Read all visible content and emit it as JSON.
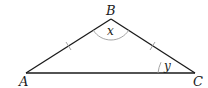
{
  "diagram": {
    "type": "isosceles-triangle",
    "vertices": {
      "A": "A",
      "B": "B",
      "C": "C"
    },
    "angles": {
      "at_B": "x",
      "at_C": "y"
    },
    "equal_sides": [
      "AB",
      "BC"
    ],
    "colors": {
      "line": "#1a1a1a",
      "arc": "#9a9a9a"
    }
  }
}
